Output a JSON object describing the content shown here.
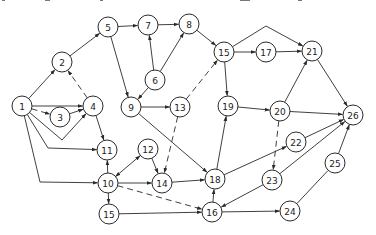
{
  "diagram": {
    "type": "directed-network",
    "node_radius": 10,
    "colors": {
      "stroke": "#2a2a2a",
      "fill": "#ffffff",
      "text": "#222222"
    },
    "nodes": [
      {
        "id": "n1",
        "label": "1",
        "x": 22,
        "y": 106
      },
      {
        "id": "n2",
        "label": "2",
        "x": 62,
        "y": 62
      },
      {
        "id": "n3",
        "label": "3",
        "x": 60,
        "y": 117
      },
      {
        "id": "n4",
        "label": "4",
        "x": 93,
        "y": 106
      },
      {
        "id": "n5",
        "label": "5",
        "x": 108,
        "y": 27
      },
      {
        "id": "n6",
        "label": "6",
        "x": 155,
        "y": 80
      },
      {
        "id": "n7",
        "label": "7",
        "x": 148,
        "y": 25
      },
      {
        "id": "n8",
        "label": "8",
        "x": 189,
        "y": 24
      },
      {
        "id": "n9",
        "label": "9",
        "x": 131,
        "y": 107
      },
      {
        "id": "n10",
        "label": "10",
        "x": 108,
        "y": 183
      },
      {
        "id": "n11",
        "label": "11",
        "x": 107,
        "y": 150
      },
      {
        "id": "n12",
        "label": "12",
        "x": 148,
        "y": 149
      },
      {
        "id": "n13",
        "label": "13",
        "x": 180,
        "y": 107
      },
      {
        "id": "n14",
        "label": "14",
        "x": 162,
        "y": 183
      },
      {
        "id": "n15a",
        "label": "15",
        "x": 224,
        "y": 52
      },
      {
        "id": "n15b",
        "label": "15",
        "x": 109,
        "y": 214
      },
      {
        "id": "n16",
        "label": "16",
        "x": 212,
        "y": 212
      },
      {
        "id": "n17",
        "label": "17",
        "x": 266,
        "y": 52
      },
      {
        "id": "n18",
        "label": "18",
        "x": 215,
        "y": 179
      },
      {
        "id": "n19",
        "label": "19",
        "x": 228,
        "y": 106
      },
      {
        "id": "n20",
        "label": "20",
        "x": 280,
        "y": 111
      },
      {
        "id": "n21",
        "label": "21",
        "x": 312,
        "y": 51
      },
      {
        "id": "n22",
        "label": "22",
        "x": 296,
        "y": 142
      },
      {
        "id": "n23",
        "label": "23",
        "x": 272,
        "y": 180
      },
      {
        "id": "n24",
        "label": "24",
        "x": 290,
        "y": 211
      },
      {
        "id": "n25",
        "label": "25",
        "x": 335,
        "y": 163
      },
      {
        "id": "n26",
        "label": "26",
        "x": 353,
        "y": 115
      }
    ],
    "edges": [
      {
        "from": "n1",
        "to": "n2",
        "style": "solid"
      },
      {
        "from": "n1",
        "to": "n4",
        "style": "solid"
      },
      {
        "from": "n1",
        "to": "n3",
        "style": "dashed"
      },
      {
        "from": "n3",
        "to": "n4",
        "style": "solid"
      },
      {
        "from": "n1",
        "to": "n4",
        "style": "solid",
        "via": [
          [
            62,
            140
          ]
        ]
      },
      {
        "from": "n1",
        "to": "n11",
        "style": "solid",
        "via": [
          [
            48,
            148
          ]
        ]
      },
      {
        "from": "n1",
        "to": "n10",
        "style": "solid",
        "via": [
          [
            40,
            182
          ]
        ]
      },
      {
        "from": "n4",
        "to": "n2",
        "style": "dashed"
      },
      {
        "from": "n4",
        "to": "n11",
        "style": "solid"
      },
      {
        "from": "n2",
        "to": "n5",
        "style": "solid"
      },
      {
        "from": "n5",
        "to": "n7",
        "style": "solid"
      },
      {
        "from": "n5",
        "to": "n9",
        "style": "solid"
      },
      {
        "from": "n7",
        "to": "n8",
        "style": "solid"
      },
      {
        "from": "n6",
        "to": "n7",
        "style": "solid"
      },
      {
        "from": "n6",
        "to": "n8",
        "style": "solid"
      },
      {
        "from": "n6",
        "to": "n9",
        "style": "solid"
      },
      {
        "from": "n8",
        "to": "n15a",
        "style": "solid"
      },
      {
        "from": "n9",
        "to": "n13",
        "style": "solid"
      },
      {
        "from": "n9",
        "to": "n18",
        "style": "solid"
      },
      {
        "from": "n13",
        "to": "n15a",
        "style": "dashed"
      },
      {
        "from": "n13",
        "to": "n14",
        "style": "dashed"
      },
      {
        "from": "n10",
        "to": "n11",
        "style": "solid"
      },
      {
        "from": "n10",
        "to": "n12",
        "style": "solid",
        "bidirectional": true
      },
      {
        "from": "n12",
        "to": "n14",
        "style": "solid"
      },
      {
        "from": "n10",
        "to": "n14",
        "style": "solid"
      },
      {
        "from": "n10",
        "to": "n15b",
        "style": "solid"
      },
      {
        "from": "n10",
        "to": "n16",
        "style": "dashed"
      },
      {
        "from": "n15b",
        "to": "n16",
        "style": "solid"
      },
      {
        "from": "n14",
        "to": "n18",
        "style": "solid"
      },
      {
        "from": "n16",
        "to": "n18",
        "style": "solid"
      },
      {
        "from": "n16",
        "to": "n24",
        "style": "solid"
      },
      {
        "from": "n23",
        "to": "n16",
        "style": "solid"
      },
      {
        "from": "n18",
        "to": "n19",
        "style": "solid"
      },
      {
        "from": "n18",
        "to": "n22",
        "style": "solid"
      },
      {
        "from": "n15a",
        "to": "n17",
        "style": "solid"
      },
      {
        "from": "n15a",
        "to": "n19",
        "style": "solid"
      },
      {
        "from": "n15a",
        "to": "n21",
        "style": "solid",
        "via": [
          [
            266,
            26
          ]
        ]
      },
      {
        "from": "n17",
        "to": "n21",
        "style": "solid"
      },
      {
        "from": "n19",
        "to": "n20",
        "style": "solid"
      },
      {
        "from": "n20",
        "to": "n21",
        "style": "solid"
      },
      {
        "from": "n20",
        "to": "n26",
        "style": "solid"
      },
      {
        "from": "n20",
        "to": "n23",
        "style": "dashed"
      },
      {
        "from": "n21",
        "to": "n26",
        "style": "solid"
      },
      {
        "from": "n22",
        "to": "n26",
        "style": "solid"
      },
      {
        "from": "n23",
        "to": "n26",
        "style": "solid"
      },
      {
        "from": "n24",
        "to": "n25",
        "style": "solid",
        "arrow": false
      },
      {
        "from": "n25",
        "to": "n26",
        "style": "solid"
      }
    ]
  }
}
